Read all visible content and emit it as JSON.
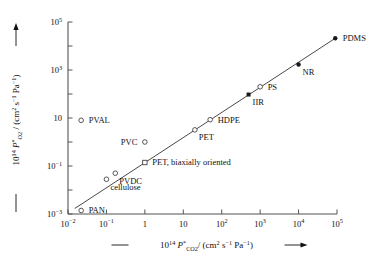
{
  "chart_data": {
    "type": "scatter",
    "title": "",
    "xlabel": "10^14 P*_CO2 / (cm^2 s^-1 Pa^-1)",
    "ylabel": "10^14 P*_O2 / (cm^2 s^-1 Pa^-1)",
    "xscale": "log",
    "yscale": "log",
    "xlim": [
      0.01,
      100000
    ],
    "ylim": [
      0.001,
      100000
    ],
    "xticks": [
      "10^-2",
      "10^-1",
      "1",
      "10",
      "10^2",
      "10^3",
      "10^4",
      "10^5"
    ],
    "xtick_values": [
      0.01,
      0.1,
      1,
      10,
      100,
      1000,
      10000,
      100000
    ],
    "yticks": [
      "10^-3",
      "10^-1",
      "10",
      "10^3",
      "10^5"
    ],
    "ytick_values": [
      0.001,
      0.1,
      10,
      1000,
      100000
    ],
    "grid": false,
    "legend": "none",
    "trendline": {
      "label": "correlation line",
      "x_start": 0.015,
      "y_start": 0.0017,
      "x_end": 90000,
      "y_end": 21000
    },
    "points": [
      {
        "name": "PAN",
        "label": "PAN",
        "x": 0.022,
        "y": 0.0014,
        "marker": "open-circle",
        "label_pos": "right"
      },
      {
        "name": "PVAL",
        "label": "PVAL",
        "x": 0.022,
        "y": 8,
        "marker": "open-circle",
        "label_pos": "right"
      },
      {
        "name": "cellulose",
        "label": "cellulose",
        "x": 0.1,
        "y": 0.028,
        "marker": "open-circle",
        "label_pos": "below-right"
      },
      {
        "name": "PVDC",
        "label": "PVDC",
        "x": 0.17,
        "y": 0.05,
        "marker": "open-circle",
        "label_pos": "below-right"
      },
      {
        "name": "PVC",
        "label": "PVC",
        "x": 1.0,
        "y": 1.0,
        "marker": "open-circle",
        "label_pos": "left"
      },
      {
        "name": "PET-biax",
        "label": "PET, biaxially oriented",
        "x": 1.0,
        "y": 0.14,
        "marker": "open-square",
        "label_pos": "right"
      },
      {
        "name": "PET",
        "label": "PET",
        "x": 20,
        "y": 3.2,
        "marker": "open-circle",
        "label_pos": "below-right"
      },
      {
        "name": "HDPE",
        "label": "HDPE",
        "x": 50,
        "y": 8.5,
        "marker": "open-circle",
        "label_pos": "right"
      },
      {
        "name": "IIR",
        "label": "IIR",
        "x": 500,
        "y": 95,
        "marker": "filled-square",
        "label_pos": "below-right"
      },
      {
        "name": "PS",
        "label": "PS",
        "x": 1000,
        "y": 200,
        "marker": "open-circle",
        "label_pos": "right"
      },
      {
        "name": "NR",
        "label": "NR",
        "x": 10000,
        "y": 1700,
        "marker": "filled-circle",
        "label_pos": "below-right"
      },
      {
        "name": "PDMS",
        "label": "PDMS",
        "x": 90000,
        "y": 21000,
        "marker": "filled-circle",
        "label_pos": "right"
      }
    ]
  },
  "axes": {
    "x_title": {
      "prefix": "10",
      "prefix_exp": "14",
      "symbol": "P",
      "symbol_star": "*",
      "symbol_sub": "CO",
      "symbol_sub2": "2",
      "slash": "/",
      "units_open": "(cm",
      "units_exp1": "2",
      "units_mid": " s",
      "units_exp2": "−1",
      "units_mid2": " Pa",
      "units_exp3": "−1",
      "units_close": ")"
    },
    "y_title": {
      "prefix": "10",
      "prefix_exp": "14",
      "symbol": "P",
      "symbol_star": "*",
      "symbol_sub": "O",
      "symbol_sub2": "2",
      "slash": "/",
      "units_open": "(cm",
      "units_exp1": "2",
      "units_mid": " s",
      "units_exp2": "−1",
      "units_mid2": " Pa",
      "units_exp3": "−1",
      "units_close": ")"
    },
    "x_ticks": [
      {
        "mant": "10",
        "exp": "−2",
        "val": 0.01
      },
      {
        "mant": "10",
        "exp": "−1",
        "val": 0.1
      },
      {
        "mant": "1",
        "exp": "",
        "val": 1
      },
      {
        "mant": "10",
        "exp": "",
        "val": 10
      },
      {
        "mant": "10",
        "exp": "2",
        "val": 100
      },
      {
        "mant": "10",
        "exp": "3",
        "val": 1000
      },
      {
        "mant": "10",
        "exp": "4",
        "val": 10000
      },
      {
        "mant": "10",
        "exp": "5",
        "val": 100000
      }
    ],
    "y_ticks": [
      {
        "mant": "10",
        "exp": "−3",
        "val": 0.001
      },
      {
        "mant": "10",
        "exp": "−1",
        "val": 0.1
      },
      {
        "mant": "10",
        "exp": "",
        "val": 10
      },
      {
        "mant": "10",
        "exp": "3",
        "val": 1000
      },
      {
        "mant": "10",
        "exp": "5",
        "val": 100000
      }
    ]
  },
  "style": {
    "axis_color": "#555555",
    "line_color": "#333333",
    "marker_open_stroke": "#444444",
    "marker_filled_fill": "#1a1a1a",
    "text_color": "#111111"
  }
}
